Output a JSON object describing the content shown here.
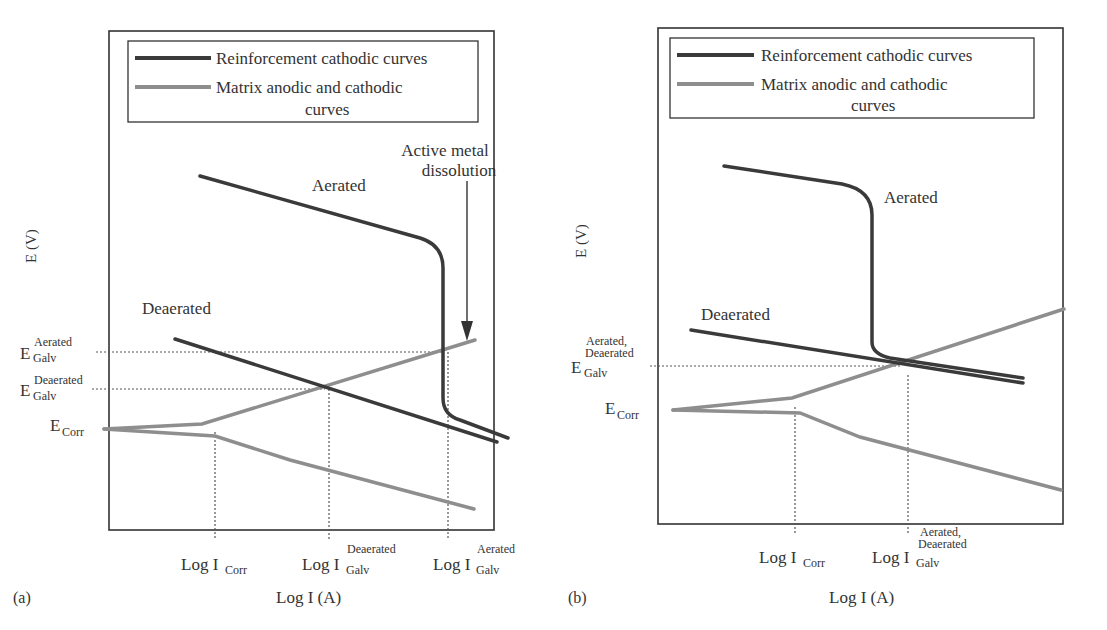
{
  "legend": {
    "reinforcement": "Reinforcement cathodic curves",
    "matrix_line1": "Matrix anodic and cathodic",
    "matrix_line2": "curves"
  },
  "colors": {
    "reinforcement": "#3a3a3a",
    "matrix": "#8e8e8e",
    "frame": "#333333",
    "guide": "#555555"
  },
  "panel_a": {
    "tag": "(a)",
    "y_axis_label": "E (V)",
    "x_axis_label": "Log I (A)",
    "curve_labels": {
      "aerated": "Aerated",
      "deaerated": "Deaerated"
    },
    "annotation_line1": "Active metal",
    "annotation_line2": "dissolution",
    "y_ticks": {
      "e_galv_aerated": {
        "base": "E",
        "sup": "Aerated",
        "sub": "Galv"
      },
      "e_galv_deaerated": {
        "base": "E",
        "sup": "Deaerated",
        "sub": "Galv"
      },
      "e_corr": {
        "base": "E",
        "sub": "Corr"
      }
    },
    "x_ticks": {
      "i_corr": {
        "base": "Log I",
        "sub": "Corr"
      },
      "i_galv_deaerated": {
        "base": "Log I",
        "sup": "Deaerated",
        "sub": "Galv"
      },
      "i_galv_aerated": {
        "base": "Log I",
        "sup": "Aerated",
        "sub": "Galv"
      }
    }
  },
  "panel_b": {
    "tag": "(b)",
    "y_axis_label": "E (V)",
    "x_axis_label": "Log I (A)",
    "curve_labels": {
      "aerated": "Aerated",
      "deaerated": "Deaerated"
    },
    "y_ticks": {
      "e_galv": {
        "base": "E",
        "sup1": "Aerated,",
        "sup2": "Deaerated",
        "sub": "Galv"
      },
      "e_corr": {
        "base": "E",
        "sub": "Corr"
      }
    },
    "x_ticks": {
      "i_corr": {
        "base": "Log I",
        "sub": "Corr"
      },
      "i_galv": {
        "base": "Log I",
        "sup1": "Aerated,",
        "sup2": "Deaerated",
        "sub": "Galv"
      }
    }
  }
}
